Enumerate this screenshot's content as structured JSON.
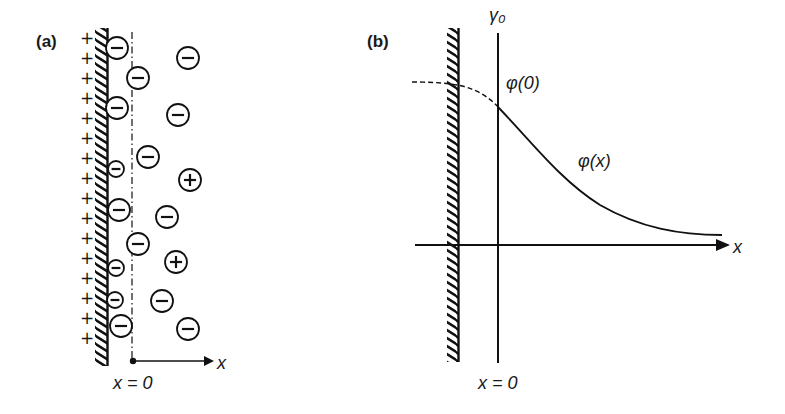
{
  "figure": {
    "panel_a": {
      "label": "(a)",
      "surface_charge_sign": "+",
      "surface_charge_count": 16,
      "surface_charge_y": [
        38,
        58,
        78,
        98,
        118,
        138,
        158,
        178,
        198,
        218,
        238,
        258,
        278,
        298,
        318,
        338
      ],
      "ions": [
        {
          "sign": "−",
          "x": 117,
          "y": 48,
          "r": 11
        },
        {
          "sign": "−",
          "x": 188,
          "y": 58,
          "r": 11
        },
        {
          "sign": "−",
          "x": 138,
          "y": 78,
          "r": 11
        },
        {
          "sign": "−",
          "x": 117,
          "y": 108,
          "r": 11
        },
        {
          "sign": "−",
          "x": 178,
          "y": 115,
          "r": 11
        },
        {
          "sign": "−",
          "x": 148,
          "y": 157,
          "r": 11
        },
        {
          "sign": "−",
          "x": 116,
          "y": 169,
          "r": 8
        },
        {
          "sign": "+",
          "x": 190,
          "y": 180,
          "r": 11
        },
        {
          "sign": "−",
          "x": 119,
          "y": 210,
          "r": 11
        },
        {
          "sign": "−",
          "x": 167,
          "y": 217,
          "r": 11
        },
        {
          "sign": "−",
          "x": 138,
          "y": 244,
          "r": 11
        },
        {
          "sign": "+",
          "x": 176,
          "y": 262,
          "r": 11
        },
        {
          "sign": "−",
          "x": 116,
          "y": 268,
          "r": 8
        },
        {
          "sign": "−",
          "x": 115,
          "y": 300,
          "r": 8
        },
        {
          "sign": "−",
          "x": 162,
          "y": 301,
          "r": 11
        },
        {
          "sign": "−",
          "x": 121,
          "y": 326,
          "r": 11
        },
        {
          "sign": "−",
          "x": 188,
          "y": 329,
          "r": 11
        }
      ],
      "axis_label": "x",
      "origin_label": "x = 0"
    },
    "panel_b": {
      "label": "(b)",
      "plane_label": "γ₀",
      "surface_potential_label": "φ(0)",
      "potential_curve_label": "φ(x)",
      "axis_label": "x",
      "origin_label": "x = 0"
    }
  }
}
